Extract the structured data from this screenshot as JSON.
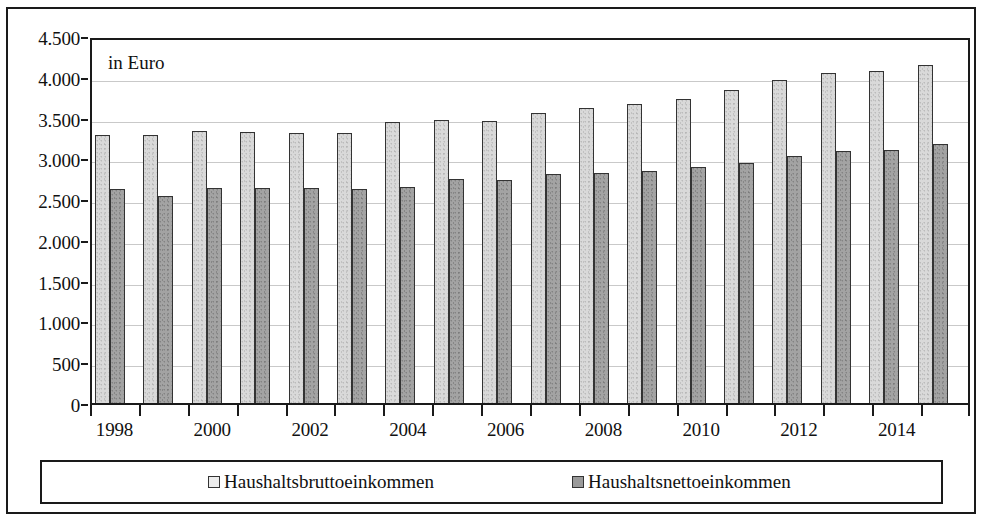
{
  "annotation": "in Euro",
  "colors": {
    "brutto_fill": "#d9d9d9",
    "netto_fill": "#a3a3a3",
    "bar_outline": "#333333",
    "frame": "#1a1a1a",
    "gridline": "#c9c9c9"
  },
  "y_axis": {
    "ticks": [
      "0",
      "500",
      "1.000",
      "1.500",
      "2.000",
      "2.500",
      "3.000",
      "3.500",
      "4.000",
      "4.500"
    ]
  },
  "x_axis": {
    "visible_labels": [
      "1998",
      "2000",
      "2002",
      "2004",
      "2006",
      "2008",
      "2010",
      "2012",
      "2014"
    ]
  },
  "legend": {
    "entries": [
      {
        "label": "Haushaltsbruttoeinkommen",
        "swatch": "light-gray-square"
      },
      {
        "label": "Haushaltsnettoeinkommen",
        "swatch": "dark-gray-square"
      }
    ]
  },
  "chart_data": {
    "type": "bar",
    "title": "",
    "subtitle": "",
    "xlabel": "",
    "ylabel": "",
    "annotation": "in Euro",
    "ylim": [
      0,
      4500
    ],
    "ytick_step": 500,
    "grid": true,
    "legend_position": "bottom",
    "categories": [
      "1998",
      "1999",
      "2000",
      "2001",
      "2002",
      "2003",
      "2004",
      "2005",
      "2006",
      "2007",
      "2008",
      "2009",
      "2010",
      "2011",
      "2012",
      "2013",
      "2014",
      "2015"
    ],
    "series": [
      {
        "name": "Haushaltsbruttoeinkommen",
        "color": "#d9d9d9",
        "values": [
          3290,
          3290,
          3340,
          3320,
          3310,
          3310,
          3450,
          3470,
          3460,
          3560,
          3620,
          3670,
          3730,
          3840,
          3960,
          4050,
          4070,
          4150
        ]
      },
      {
        "name": "Haushaltsnettoeinkommen",
        "color": "#a3a3a3",
        "values": [
          2620,
          2540,
          2640,
          2640,
          2640,
          2630,
          2650,
          2750,
          2740,
          2810,
          2820,
          2840,
          2890,
          2940,
          3030,
          3090,
          3100,
          3170
        ]
      }
    ]
  }
}
